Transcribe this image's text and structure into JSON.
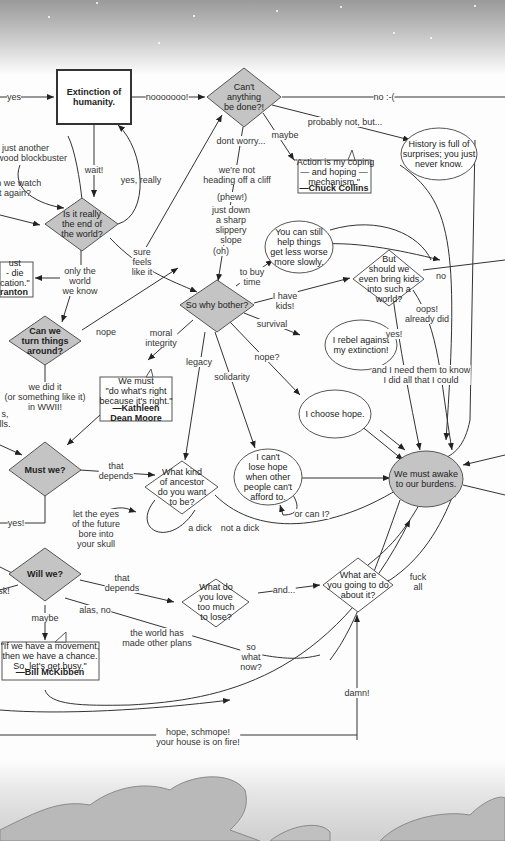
{
  "diagram": {
    "nodes": {
      "extinction": "Extinction of\nhumanity.",
      "cant_anything": "Can't\nanything\nbe done?!",
      "is_it_really": "Is it really\nthe end of\nthe world?",
      "can_we_turn": "Can we\nturn things\naround?",
      "must_we": "Must we?",
      "will_we": "Will we?",
      "so_why_bother": "So why bother?",
      "history_cloud": "History is full of\nsurprises; you just\nnever know.",
      "chuck_collins_quote": "\"Action is my coping\n— and hoping —\nmechanism.\"",
      "chuck_collins_attr": "—Chuck Collins",
      "still_help_cloud": "You can still\nhelp things\nget less worse\nmore slowly.",
      "bring_kids": "But\nshould we\neven bring kids\ninto such a\nworld?",
      "rebel_cloud": "I rebel against\nmy extinction!",
      "choose_hope_cloud": "I choose hope.",
      "cant_lose_hope_cloud": "I can't\nlose hope\nwhen other\npeople can't\nafford to.",
      "awake_burdens_cloud": "We must awake\nto our burdens.",
      "kathleen_quote": "We must\n\"do what's right\nbecause it's right.\"",
      "kathleen_attr": "—Kathleen\nDean Moore",
      "what_ancestor": "What kind\nof ancestor\ndo you want\nto be?",
      "what_love": "What do\nyou love\ntoo much\nto lose?",
      "what_going_to_do": "What are\nyou going to do\nabout it?",
      "mckibben_quote": "\"If we have a movement,\nthen we have a chance.\nSo, let's get busy.\"",
      "mckibben_attr": "—Bill McKibben",
      "left_quote_partial": "ust\n- die\ncation.\"",
      "left_quote_attr_partial": "ranton"
    },
    "edges": {
      "yes": "yes",
      "nooooooo": "nooooooo!",
      "no_sad": "no :-(",
      "hollywood": "nope, just another\nHollywood blockbuster",
      "watch_again": "can we watch\nit again?",
      "wait": "wait!",
      "yes_really": "yes, really",
      "dont_worry": "dont worry...",
      "not_cliff": "we're not\nheading off a cliff",
      "phew": "(phew!)",
      "slippery": "just down\na sharp\nslippery\nslope",
      "oh": "(oh)",
      "maybe_top": "maybe",
      "probably_not": "probably not, but...",
      "sure_feels": "sure\nfeels\nlike it",
      "only_world": "only the\nworld\nwe know",
      "to_buy_time": "to buy\ntime",
      "i_have_kids": "I have\nkids!",
      "no_kids": "no",
      "oops": "oops!\nalready did",
      "yes_kids": "yes!",
      "need_them": "and I need them to know\nI did all that I could",
      "survival": "survival",
      "nope_hope": "nope?",
      "nope": "nope",
      "moral_integrity": "moral\nintegrity",
      "legacy": "legacy",
      "solidarity": "solidarity",
      "we_did_it": "we did it\n(or something like it)\nin WWII!",
      "left_partial": "s,\nlls.",
      "that_depends_1": "that\ndepends",
      "yes_must": "yes!",
      "eyes_future": "let the eyes\nof the future\nbore into\nyour skull",
      "a_dick": "a dick",
      "not_a_dick": "not a dick",
      "or_can_i": "or can I?",
      "that_depends_2": "that\ndepends",
      "alas_no": "alas, no",
      "world_plans": "the world has\nmade other plans",
      "maybe_will": "maybe",
      "risk_partial": "isk!",
      "and": "and...",
      "fuck_all": "fuck\nall",
      "so_what_now": "so\nwhat\nnow?",
      "damn": "damn!",
      "hope_schmope": "hope, schmope!\nyour house is on fire!"
    },
    "colors": {
      "decision_fill": "#c4c4c4",
      "outline": "#333333",
      "background": "#fdfdfd"
    }
  }
}
